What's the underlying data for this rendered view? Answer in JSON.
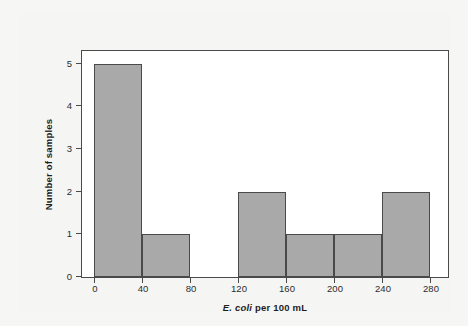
{
  "figure": {
    "background_color": "#f5f5f4",
    "plot_background_color": "#ffffff",
    "frame_color": "#4a4a4a",
    "bar_fill_color": "#a9a9a9",
    "bar_edge_color": "#4a4a4a"
  },
  "axis": {
    "xlabel_prefix": "E. coli",
    "xlabel_suffix": " per 100 mL",
    "ylabel": "Number of samples"
  },
  "chart_data": {
    "type": "bar",
    "title": "",
    "subtitle": "",
    "xlabel": "E. coli per 100 mL",
    "ylabel": "Number of samples",
    "xlim": [
      -10,
      295
    ],
    "ylim": [
      0,
      5.3
    ],
    "grid": false,
    "legend": false,
    "legend_position": "none",
    "bin_width": 40,
    "bin_edges": [
      0,
      40,
      80,
      120,
      160,
      200,
      240,
      280
    ],
    "categories": [
      "0-40",
      "40-80",
      "80-120",
      "120-160",
      "160-200",
      "200-240",
      "240-280"
    ],
    "values": [
      5,
      1,
      0,
      2,
      1,
      1,
      2
    ],
    "bars": [
      {
        "label": "0-40",
        "start": 0,
        "end": 40,
        "value": 5
      },
      {
        "label": "40-80",
        "start": 40,
        "end": 80,
        "value": 1
      },
      {
        "label": "80-120",
        "start": 80,
        "end": 120,
        "value": 0
      },
      {
        "label": "120-160",
        "start": 120,
        "end": 160,
        "value": 2
      },
      {
        "label": "160-200",
        "start": 160,
        "end": 200,
        "value": 1
      },
      {
        "label": "200-240",
        "start": 200,
        "end": 240,
        "value": 1
      },
      {
        "label": "240-280",
        "start": 240,
        "end": 280,
        "value": 2
      }
    ],
    "xticks": [
      0,
      40,
      80,
      120,
      160,
      200,
      240,
      280
    ],
    "xtick_labels": [
      "0",
      "40",
      "80",
      "120",
      "160",
      "200",
      "240",
      "280"
    ],
    "yticks": [
      0,
      1,
      2,
      3,
      4,
      5
    ],
    "ytick_labels": [
      "0",
      "1",
      "2",
      "3",
      "4",
      "5"
    ],
    "total_samples": 12
  }
}
